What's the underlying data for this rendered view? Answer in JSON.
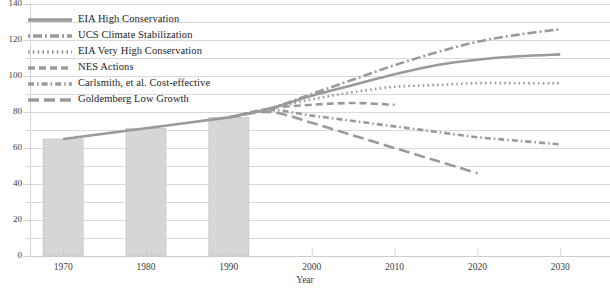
{
  "chart_data": {
    "type": "line",
    "title": "",
    "xlabel": "Year",
    "ylabel": "",
    "xlim": [
      1966,
      2036
    ],
    "ylim": [
      0,
      140
    ],
    "grid": true,
    "grid_major_step": 20,
    "grid_minor_step": 10,
    "legend_position": "upper-left-inside",
    "x_ticks": [
      1970,
      1980,
      1990,
      2000,
      2010,
      2020,
      2030
    ],
    "y_ticks": [
      0,
      20,
      40,
      60,
      80,
      100,
      120,
      140
    ],
    "y_minor_ticks": [
      10,
      30,
      50,
      70,
      90,
      110,
      130
    ],
    "bars": {
      "name": "Historical consumption",
      "color": "#d6d6d6",
      "edge_color": "#bbbbbb",
      "categories": [
        1970,
        1980,
        1990
      ],
      "values": [
        65,
        71,
        77
      ]
    },
    "series": [
      {
        "name": "EIA High Conservation",
        "style": "solid",
        "color": "#9a9a9a",
        "x": [
          1990,
          1995,
          2000,
          2005,
          2010,
          2015,
          2020,
          2025,
          2030
        ],
        "values": [
          77,
          82,
          89,
          95,
          101,
          106,
          109,
          111,
          112
        ]
      },
      {
        "name": "UCS Climate Stabilization",
        "style": "dashdot",
        "color": "#9a9a9a",
        "x": [
          1990,
          1995,
          2000,
          2005,
          2010,
          2015,
          2020,
          2025,
          2030
        ],
        "values": [
          77,
          82,
          90,
          98,
          106,
          113,
          119,
          123,
          126
        ]
      },
      {
        "name": "EIA Very High Conservation",
        "style": "dotted",
        "color": "#9a9a9a",
        "x": [
          1990,
          1995,
          2000,
          2005,
          2010,
          2015,
          2020,
          2025,
          2030
        ],
        "values": [
          77,
          82,
          87,
          91,
          94,
          95,
          96,
          96,
          96
        ]
      },
      {
        "name": "NES Actions",
        "style": "dashed",
        "color": "#9a9a9a",
        "x": [
          1990,
          1995,
          2000,
          2005,
          2010
        ],
        "values": [
          77,
          82,
          84,
          85,
          84
        ]
      },
      {
        "name": "Carlsmith, et al. Cost-effective",
        "style": "dashdotdot",
        "color": "#9a9a9a",
        "x": [
          1990,
          1995,
          2000,
          2005,
          2010,
          2015,
          2020,
          2025,
          2030
        ],
        "values": [
          77,
          81,
          78,
          75,
          72,
          69,
          66,
          64,
          62
        ]
      },
      {
        "name": "Goldemberg Low Growth",
        "style": "longdash",
        "color": "#9a9a9a",
        "x": [
          1990,
          1995,
          2000,
          2005,
          2010,
          2015,
          2020
        ],
        "values": [
          77,
          80,
          74,
          67,
          60,
          53,
          46
        ]
      }
    ]
  },
  "legend": {
    "items": [
      {
        "label": "EIA High Conservation",
        "style": "solid"
      },
      {
        "label": "UCS Climate Stabilization",
        "style": "dashdot"
      },
      {
        "label": "EIA Very High Conservation",
        "style": "dotted"
      },
      {
        "label": "NES Actions",
        "style": "dashed"
      },
      {
        "label": "Carlsmith, et al. Cost-effective",
        "style": "dashdotdot"
      },
      {
        "label": "Goldemberg Low Growth",
        "style": "longdash"
      }
    ]
  },
  "axis": {
    "y_labels": [
      "140",
      "120",
      "100",
      "80",
      "60",
      "40",
      "20",
      "0"
    ],
    "x_labels": [
      "1970",
      "1980",
      "1990",
      "2000",
      "2010",
      "2020",
      "2030"
    ],
    "x_title": "Year"
  },
  "colors": {
    "line": "#9a9a9a",
    "bar_fill": "#d6d6d6",
    "bar_edge": "#bcbcbc",
    "grid": "#c9c9c9",
    "text": "#2f2f2f"
  }
}
